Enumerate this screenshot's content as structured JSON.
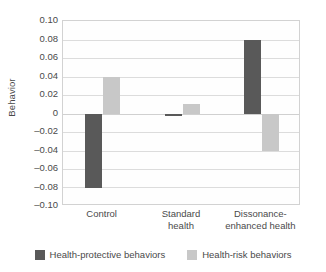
{
  "chart_data": {
    "type": "bar",
    "title": "",
    "xlabel": "",
    "ylabel": "Behavior",
    "ylim": [
      -0.1,
      0.1
    ],
    "ytick_labels": [
      "0.10",
      "0.08",
      "0.06",
      "0.04",
      "0.02",
      "0",
      "–0.02",
      "–0.04",
      "–0.06",
      "–0.08",
      "–0.10"
    ],
    "ytick_values": [
      0.1,
      0.08,
      0.06,
      0.04,
      0.02,
      0,
      -0.02,
      -0.04,
      -0.06,
      -0.08,
      -0.1
    ],
    "grid": true,
    "legend_position": "bottom-center",
    "categories": [
      "Control",
      "Standard health",
      "Dissonance-enhanced health"
    ],
    "category_lines": [
      [
        "Control"
      ],
      [
        "Standard",
        "health"
      ],
      [
        "Dissonance-",
        "enhanced health"
      ]
    ],
    "series": [
      {
        "name": "Health-protective behaviors",
        "color": "#595959",
        "values": [
          -0.08,
          -0.003,
          0.08
        ]
      },
      {
        "name": "Health-risk behaviors",
        "color": "#c8c8c8",
        "values": [
          0.04,
          0.01,
          -0.04
        ]
      }
    ]
  },
  "legend": {
    "items": [
      {
        "label": "Health-protective behaviors",
        "color": "#595959"
      },
      {
        "label": "Health-risk behaviors",
        "color": "#c8c8c8"
      }
    ]
  }
}
